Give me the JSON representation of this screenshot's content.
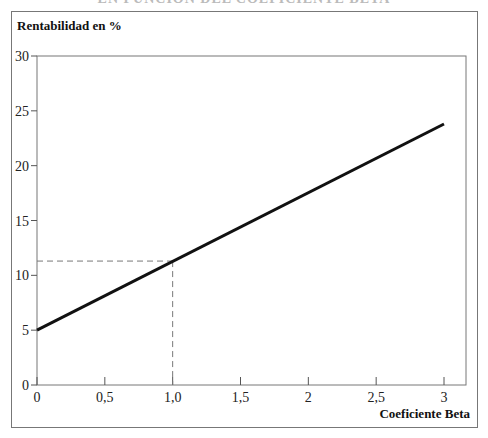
{
  "header": {
    "title_partial": "EN FUNCIÓN DEL COEFICIENTE BETA"
  },
  "chart_data": {
    "type": "line",
    "title": "EN FUNCIÓN DEL COEFICIENTE BETA",
    "xlabel": "Coeficiente Beta",
    "ylabel": "Rentabilidad en %",
    "xlim": [
      0,
      3
    ],
    "ylim": [
      0,
      30
    ],
    "x_ticks": [
      "0",
      "0,5",
      "1,0",
      "1,5",
      "2",
      "2,5",
      "3"
    ],
    "y_ticks": [
      "0",
      "5",
      "10",
      "15",
      "20",
      "25",
      "30"
    ],
    "grid": false,
    "legend": null,
    "series": [
      {
        "name": "Rentabilidad esperada",
        "x": [
          0,
          3
        ],
        "y": [
          5,
          23.8
        ],
        "style": "solid",
        "color": "#111111"
      }
    ],
    "annotations": [
      {
        "type": "dashed-guide",
        "x": 1.0,
        "y": 11.3,
        "color": "#777777"
      }
    ]
  }
}
